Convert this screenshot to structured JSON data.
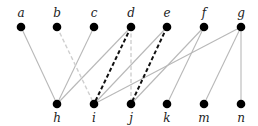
{
  "diagram": {
    "type": "bipartite-graph",
    "top_nodes": [
      {
        "id": "a",
        "label": "a",
        "x": 21,
        "y": 27
      },
      {
        "id": "b",
        "label": "b",
        "x": 57,
        "y": 27
      },
      {
        "id": "c",
        "label": "c",
        "x": 94,
        "y": 27
      },
      {
        "id": "d",
        "label": "d",
        "x": 131,
        "y": 27
      },
      {
        "id": "e",
        "label": "e",
        "x": 167,
        "y": 27
      },
      {
        "id": "f",
        "label": "f",
        "x": 204,
        "y": 27
      },
      {
        "id": "g",
        "label": "g",
        "x": 241,
        "y": 27
      }
    ],
    "bottom_nodes": [
      {
        "id": "h",
        "label": "h",
        "x": 57,
        "y": 104
      },
      {
        "id": "i",
        "label": "i",
        "x": 94,
        "y": 104
      },
      {
        "id": "j",
        "label": "j",
        "x": 131,
        "y": 104
      },
      {
        "id": "k",
        "label": "k",
        "x": 167,
        "y": 104
      },
      {
        "id": "m",
        "label": "m",
        "x": 204,
        "y": 104
      },
      {
        "id": "n",
        "label": "n",
        "x": 241,
        "y": 104
      }
    ],
    "edges": [
      {
        "from": "a",
        "to": "h",
        "style": "solid-gray"
      },
      {
        "from": "c",
        "to": "h",
        "style": "solid-gray"
      },
      {
        "from": "d",
        "to": "h",
        "style": "solid-gray"
      },
      {
        "from": "e",
        "to": "i",
        "style": "solid-gray"
      },
      {
        "from": "g",
        "to": "i",
        "style": "solid-gray"
      },
      {
        "from": "f",
        "to": "j",
        "style": "solid-gray"
      },
      {
        "from": "f",
        "to": "k",
        "style": "solid-gray"
      },
      {
        "from": "g",
        "to": "m",
        "style": "solid-gray"
      },
      {
        "from": "g",
        "to": "n",
        "style": "solid-gray"
      },
      {
        "from": "b",
        "to": "i",
        "style": "dashed-light"
      },
      {
        "from": "d",
        "to": "j",
        "style": "dashed-light"
      },
      {
        "from": "d",
        "to": "i",
        "style": "dashed-bold"
      },
      {
        "from": "e",
        "to": "j",
        "style": "dashed-bold"
      }
    ],
    "colors": {
      "node": "#000000",
      "solid_edge": "#b8b8b8",
      "light_dashed_edge": "#cfcfcf",
      "bold_dashed_edge": "#111111"
    }
  }
}
